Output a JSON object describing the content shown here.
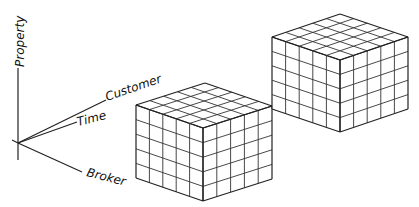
{
  "diagram": {
    "type": "data-cube-illustration",
    "axes": {
      "origin": [
        18,
        143
      ],
      "items": [
        {
          "label": "Property",
          "end": [
            18,
            68
          ],
          "tail": [
            18,
            160
          ]
        },
        {
          "label": "Customer",
          "end": [
            106,
            100
          ]
        },
        {
          "label": "Time",
          "end": [
            77,
            122
          ]
        },
        {
          "label": "Broker",
          "end": [
            82,
            172
          ]
        }
      ]
    },
    "cubes": [
      {
        "name": "cube-front",
        "divisions": 5,
        "left_top": [
          136,
          105
        ],
        "front_top": [
          203,
          128
        ],
        "right_top": [
          272,
          106
        ],
        "height": 73
      },
      {
        "name": "cube-back",
        "divisions": 5,
        "left_top": [
          272,
          37
        ],
        "front_top": [
          340,
          60
        ],
        "right_top": [
          408,
          37
        ],
        "height": 72
      }
    ]
  },
  "labels": {
    "property": "Property",
    "customer": "Customer",
    "time": "Time",
    "broker": "Broker"
  }
}
